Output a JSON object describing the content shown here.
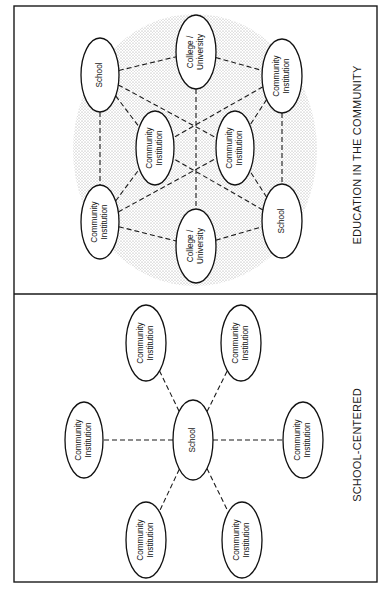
{
  "panels": {
    "education_in_community": {
      "caption": "EDUCATION IN THE COMMUNITY",
      "nodes": [
        {
          "id": "school_tl",
          "lines": [
            "School"
          ],
          "cx": 100,
          "cy": 75,
          "rx": 19,
          "ry": 37
        },
        {
          "id": "college_top",
          "lines": [
            "College /",
            "University"
          ],
          "cx": 196,
          "cy": 52,
          "rx": 20,
          "ry": 37
        },
        {
          "id": "ci_tr",
          "lines": [
            "Community",
            "Institution"
          ],
          "cx": 282,
          "cy": 76,
          "rx": 20,
          "ry": 37
        },
        {
          "id": "ci_inner_left",
          "lines": [
            "Community",
            "Institution"
          ],
          "cx": 155,
          "cy": 148,
          "rx": 19,
          "ry": 37
        },
        {
          "id": "ci_inner_right",
          "lines": [
            "Community",
            "Institution"
          ],
          "cx": 235,
          "cy": 148,
          "rx": 19,
          "ry": 37
        },
        {
          "id": "ci_bl",
          "lines": [
            "Community",
            "Institution"
          ],
          "cx": 100,
          "cy": 222,
          "rx": 19,
          "ry": 37
        },
        {
          "id": "college_bottom",
          "lines": [
            "College /",
            "University"
          ],
          "cx": 196,
          "cy": 246,
          "rx": 20,
          "ry": 37
        },
        {
          "id": "school_br",
          "lines": [
            "School"
          ],
          "cx": 282,
          "cy": 221,
          "rx": 20,
          "ry": 37
        }
      ],
      "edges": [
        [
          "school_tl",
          "college_top"
        ],
        [
          "college_top",
          "ci_tr"
        ],
        [
          "school_tl",
          "ci_inner_left"
        ],
        [
          "ci_tr",
          "ci_inner_right"
        ],
        [
          "school_tl",
          "ci_inner_right"
        ],
        [
          "ci_tr",
          "ci_inner_left"
        ],
        [
          "college_top",
          "college_bottom"
        ],
        [
          "school_tl",
          "ci_bl"
        ],
        [
          "ci_tr",
          "school_br"
        ],
        [
          "ci_bl",
          "college_bottom"
        ],
        [
          "college_bottom",
          "school_br"
        ],
        [
          "ci_bl",
          "ci_inner_left"
        ],
        [
          "ci_bl",
          "ci_inner_right"
        ],
        [
          "school_br",
          "ci_inner_left"
        ],
        [
          "school_br",
          "ci_inner_right"
        ]
      ],
      "shading": {
        "cx": 195,
        "cy": 150,
        "rx": 122,
        "ry": 136,
        "color": "#c8c8c8"
      }
    },
    "school_centered": {
      "caption": "SCHOOL-CENTERED",
      "nodes": [
        {
          "id": "school_center",
          "lines": [
            "School"
          ],
          "cx": 193,
          "cy": 440,
          "rx": 20,
          "ry": 40
        },
        {
          "id": "ci_top_left",
          "lines": [
            "Community",
            "Institution"
          ],
          "cx": 146,
          "cy": 343,
          "rx": 20,
          "ry": 38
        },
        {
          "id": "ci_top_right",
          "lines": [
            "Community",
            "Institution"
          ],
          "cx": 241,
          "cy": 343,
          "rx": 20,
          "ry": 38
        },
        {
          "id": "ci_left",
          "lines": [
            "Community",
            "Institution"
          ],
          "cx": 84,
          "cy": 440,
          "rx": 19,
          "ry": 38
        },
        {
          "id": "ci_right",
          "lines": [
            "Community",
            "Institution"
          ],
          "cx": 303,
          "cy": 440,
          "rx": 20,
          "ry": 38
        },
        {
          "id": "ci_bottom_left",
          "lines": [
            "Community",
            "Institution"
          ],
          "cx": 146,
          "cy": 540,
          "rx": 20,
          "ry": 38
        },
        {
          "id": "ci_bottom_right",
          "lines": [
            "Community",
            "Institution"
          ],
          "cx": 242,
          "cy": 540,
          "rx": 20,
          "ry": 38
        }
      ],
      "edges": [
        [
          "school_center",
          "ci_top_left"
        ],
        [
          "school_center",
          "ci_top_right"
        ],
        [
          "school_center",
          "ci_left"
        ],
        [
          "school_center",
          "ci_right"
        ],
        [
          "school_center",
          "ci_bottom_left"
        ],
        [
          "school_center",
          "ci_bottom_right"
        ]
      ]
    }
  },
  "frame": {
    "x": 14,
    "y": 6,
    "width": 363,
    "height": 576,
    "divider_y": 294
  },
  "colors": {
    "stroke": "#111111",
    "background": "#ffffff",
    "stipple": "#c8c8c8"
  }
}
